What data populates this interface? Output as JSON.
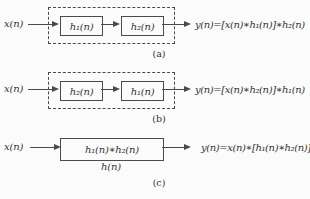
{
  "figure": {
    "diagrams": {
      "a": {
        "input": "x(n)",
        "block1": "h₁(n)",
        "block2": "h₂(n)",
        "output": "y(n)=[x(n)∗h₁(n)]∗h₂(n)",
        "caption": "(a)"
      },
      "b": {
        "input": "x(n)",
        "block1": "h₂(n)",
        "block2": "h₁(n)",
        "output": "y(n)=[x(n)∗h₂(n)]∗h₁(n)",
        "caption": "(b)"
      },
      "c": {
        "input": "x(n)",
        "block": "h₁(n)∗h₂(n)",
        "impulse_response": "h(n)",
        "output": "y(n)=x(n)∗[h₁(n)∗h₂(n)]",
        "caption": "(c)"
      }
    },
    "colors": {
      "line": "#4a4a4a",
      "text": "#333333",
      "background": "#fbfbfb"
    }
  }
}
